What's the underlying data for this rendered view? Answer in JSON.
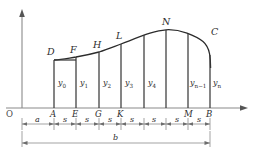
{
  "figure": {
    "type": "mathematical-diagram",
    "axes": {
      "origin_label": "O",
      "x_axis_name": "x-axis",
      "y_axis_name": "y-axis"
    },
    "curve_points": [
      {
        "label": "D",
        "x": 54,
        "y": 60
      },
      {
        "label": "F",
        "x": 76,
        "y": 57
      },
      {
        "label": "H",
        "x": 99,
        "y": 52
      },
      {
        "label": "L",
        "x": 121,
        "y": 44
      },
      {
        "label": "N",
        "x": 166,
        "y": 30
      },
      {
        "label": "C",
        "x": 210,
        "y": 39
      }
    ],
    "base_points": [
      {
        "label": "A",
        "x": 54
      },
      {
        "label": "E",
        "x": 76
      },
      {
        "label": "G",
        "x": 99
      },
      {
        "label": "K",
        "x": 121
      },
      {
        "label": "",
        "x": 144
      },
      {
        "label": "",
        "x": 166
      },
      {
        "label": "M",
        "x": 188
      },
      {
        "label": "B",
        "x": 210
      }
    ],
    "ordinate_labels": [
      {
        "text": "y",
        "sub": "0",
        "x": 62,
        "y": 83
      },
      {
        "text": "y",
        "sub": "1",
        "x": 84,
        "y": 83
      },
      {
        "text": "y",
        "sub": "2",
        "x": 106,
        "y": 83
      },
      {
        "text": "y",
        "sub": "3",
        "x": 129,
        "y": 83
      },
      {
        "text": "y",
        "sub": "4",
        "x": 151,
        "y": 83
      },
      {
        "text": "y",
        "sub": "n−1",
        "x": 193,
        "y": 83
      },
      {
        "text": "y",
        "sub": "n",
        "x": 215,
        "y": 83
      }
    ],
    "dimensions": {
      "segments": [
        {
          "label": "a",
          "from": 22,
          "to": 54
        },
        {
          "label": "s",
          "from": 54,
          "to": 76
        },
        {
          "label": "s",
          "from": 76,
          "to": 99
        },
        {
          "label": "s",
          "from": 99,
          "to": 121
        },
        {
          "label": "s",
          "from": 121,
          "to": 144
        },
        {
          "label": "s",
          "from": 144,
          "to": 166
        },
        {
          "label": "s",
          "from": 166,
          "to": 188
        },
        {
          "label": "s",
          "from": 188,
          "to": 210
        }
      ],
      "total": {
        "label": "b",
        "from": 22,
        "to": 210
      }
    },
    "colors": {
      "curve": "#2b2b2b",
      "axis": "#8a8a8a",
      "ordinate": "#3a3a3a",
      "dimension": "#7d7d7d",
      "background": "#ffffff"
    }
  }
}
